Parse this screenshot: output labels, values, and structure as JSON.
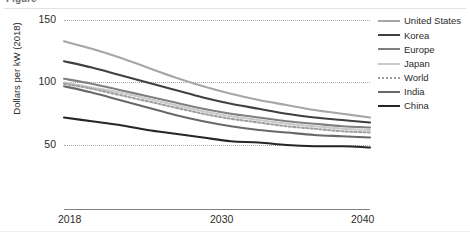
{
  "figure": {
    "title_fragment": "Figure",
    "background": "#ffffff"
  },
  "axes": {
    "y_title": "Dollars per kW (2018)",
    "y_ticks": [
      "150",
      "100",
      "50"
    ],
    "x_ticks": [
      "2018",
      "2030",
      "2040"
    ]
  },
  "legend": {
    "items": [
      {
        "label": "United States",
        "color": "#a6a6a6",
        "style": "solid"
      },
      {
        "label": "Korea",
        "color": "#404040",
        "style": "solid"
      },
      {
        "label": "Europe",
        "color": "#7f7f7f",
        "style": "solid"
      },
      {
        "label": "Japan",
        "color": "#c9c9c9",
        "style": "solid"
      },
      {
        "label": "World",
        "color": "#a0a0a0",
        "style": "dotted"
      },
      {
        "label": "India",
        "color": "#696969",
        "style": "solid"
      },
      {
        "label": "China",
        "color": "#262626",
        "style": "solid"
      }
    ]
  },
  "chart_data": {
    "type": "line",
    "title": "",
    "xlabel": "",
    "ylabel": "Dollars per kW (2018)",
    "xlim": [
      2018,
      2040
    ],
    "ylim": [
      25,
      150
    ],
    "ytick_values": [
      150,
      100,
      50
    ],
    "xtick_values": [
      2018,
      2030,
      2040
    ],
    "grid": "horizontal-dotted",
    "legend_position": "right",
    "x": [
      2018,
      2020,
      2022,
      2024,
      2026,
      2028,
      2030,
      2032,
      2034,
      2036,
      2038,
      2040
    ],
    "series": [
      {
        "name": "United States",
        "color": "#a6a6a6",
        "style": "solid",
        "values": [
          133,
          127,
          120,
          112,
          104,
          97,
          91,
          86,
          82,
          78,
          75,
          72
        ]
      },
      {
        "name": "Korea",
        "color": "#404040",
        "style": "solid",
        "values": [
          117,
          112,
          106,
          100,
          94,
          88,
          83,
          79,
          75,
          72,
          70,
          68
        ]
      },
      {
        "name": "Europe",
        "color": "#7f7f7f",
        "style": "solid",
        "values": [
          103,
          99,
          94,
          89,
          84,
          79,
          75,
          72,
          69,
          67,
          65,
          64
        ]
      },
      {
        "name": "Japan",
        "color": "#c9c9c9",
        "style": "solid",
        "values": [
          100,
          96,
          92,
          87,
          82,
          77,
          73,
          70,
          67,
          65,
          63,
          62
        ]
      },
      {
        "name": "World",
        "color": "#a0a0a0",
        "style": "dotted",
        "values": [
          99,
          95,
          90,
          85,
          80,
          75,
          71,
          68,
          65,
          63,
          61,
          60
        ]
      },
      {
        "name": "India",
        "color": "#696969",
        "style": "solid",
        "values": [
          97,
          92,
          86,
          80,
          74,
          69,
          65,
          62,
          60,
          58,
          57,
          56
        ]
      },
      {
        "name": "China",
        "color": "#262626",
        "style": "solid",
        "values": [
          72,
          69,
          66,
          62,
          59,
          56,
          53,
          52,
          50,
          49,
          49,
          48
        ]
      }
    ]
  }
}
